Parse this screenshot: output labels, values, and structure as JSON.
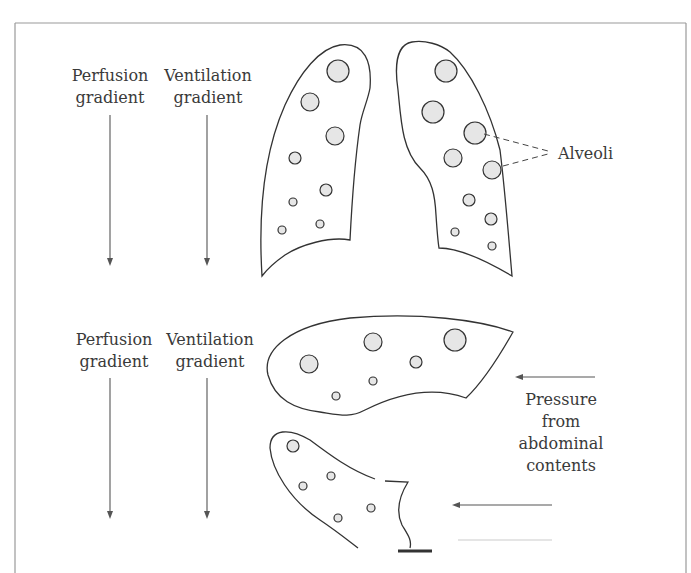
{
  "figure": {
    "type": "lung gravity diagram",
    "accent_colors": {
      "outline": "#333333",
      "alveolus_fill": "#e6e6e6",
      "arrow": "#555555",
      "text": "#3a3a3a",
      "frame": "#9a9a9a"
    }
  },
  "upright": {
    "perfusion_label": [
      "Perfusion",
      "gradient"
    ],
    "ventilation_label": [
      "Ventilation",
      "gradient"
    ],
    "alveoli_label": "Alveoli"
  },
  "supine": {
    "perfusion_label": [
      "Perfusion",
      "gradient"
    ],
    "ventilation_label": [
      "Ventilation",
      "gradient"
    ],
    "pressure_label": [
      "Pressure",
      "from",
      "abdominal",
      "contents"
    ]
  }
}
